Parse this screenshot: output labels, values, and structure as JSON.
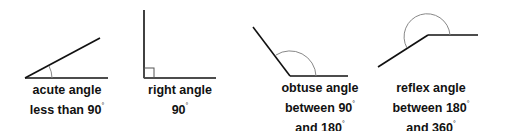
{
  "diagram": {
    "colors": {
      "line": "#111111",
      "arc": "#888888",
      "text": "#111111"
    },
    "angles": [
      {
        "name": "acute",
        "line1": "acute angle",
        "line2": "less than 90",
        "line2_sup": "°",
        "line3": "",
        "line3_sup": ""
      },
      {
        "name": "right",
        "line1": "right angle",
        "line2": "90",
        "line2_sup": "°",
        "line3": "",
        "line3_sup": ""
      },
      {
        "name": "obtuse",
        "line1": "obtuse angle",
        "line2": "between 90",
        "line2_sup": "°",
        "line3": "and 180",
        "line3_sup": "°"
      },
      {
        "name": "reflex",
        "line1": "reflex angle",
        "line2": "between 180",
        "line2_sup": "°",
        "line3": "and 360",
        "line3_sup": "°"
      }
    ]
  }
}
